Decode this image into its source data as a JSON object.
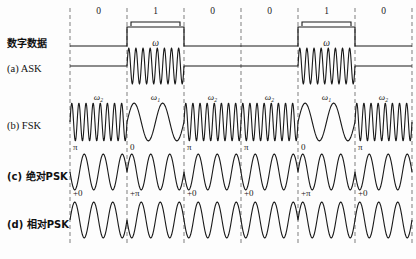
{
  "figure": {
    "width": 416,
    "height": 259,
    "background": "#fdfdfd",
    "line_color": "#1a1a1a",
    "grid_color": "#8a8a8a"
  },
  "bits": {
    "sequence": [
      "0",
      "1",
      "0",
      "0",
      "1",
      "0"
    ],
    "count": 6,
    "x_start": 70,
    "bit_width": 57,
    "top_label_y": 14,
    "bracket_y": 22
  },
  "rows": [
    {
      "id": "digital-data",
      "label_latin": "",
      "label_han": "数字数据",
      "label_full": "数字数据",
      "type": "nrz",
      "baseline_y": 46,
      "high_y": 27,
      "symbol": ""
    },
    {
      "id": "ask",
      "label_latin": "(a) ",
      "label_han": "ASK",
      "label_full": "(a) ASK",
      "type": "ask",
      "center_y": 66,
      "amplitude": 18,
      "carrier_cycles_per_bit": 8,
      "symbol": "ω",
      "symbol_y": 46,
      "symbol_bits": [
        1,
        4
      ]
    },
    {
      "id": "fsk",
      "label_latin": "(b) ",
      "label_han": "FSK",
      "label_full": "(b) FSK",
      "type": "fsk",
      "center_y": 122,
      "amplitude": 19,
      "cycles_for_zero": 8,
      "cycles_for_one": 2,
      "symbol_zero": "ω₂",
      "symbol_one": "ω₁",
      "symbol_y": 100
    },
    {
      "id": "psk-absolute",
      "label_latin": "(c) ",
      "label_han": "绝对PSK",
      "label_full": "(c) 绝对PSK",
      "type": "psk",
      "center_y": 172,
      "amplitude": 18,
      "cycles_per_bit": 3,
      "phases": [
        "π",
        "0",
        "π",
        "π",
        "0",
        "π"
      ],
      "phase_label_y": 150
    },
    {
      "id": "psk-relative",
      "label_latin": "(d) ",
      "label_han": "相对PSK",
      "label_full": "(d) 相对PSK",
      "type": "dpsk",
      "center_y": 220,
      "amplitude": 18,
      "cycles_per_bit": 3,
      "phases": [
        "+0",
        "+π",
        "+0",
        "+0",
        "+π",
        "+0"
      ],
      "phase_label_y": 196
    }
  ],
  "grid": {
    "dash_top": 8,
    "dash_bottom": 243,
    "dash_pattern": "4,3"
  }
}
